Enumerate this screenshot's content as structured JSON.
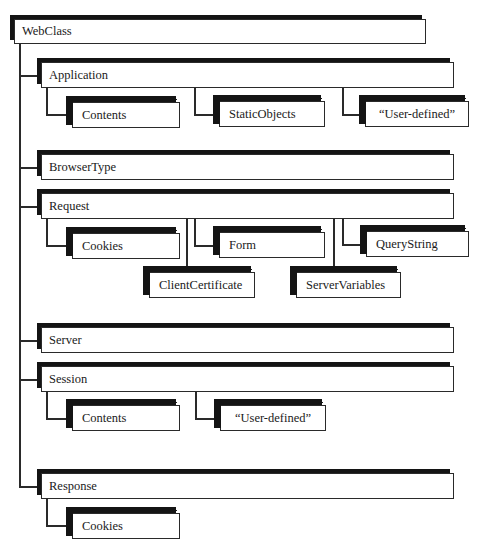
{
  "diagram": {
    "root": {
      "label": "WebClass"
    },
    "objects": {
      "application": {
        "label": "Application"
      },
      "browser_type": {
        "label": "BrowserType"
      },
      "request": {
        "label": "Request"
      },
      "server": {
        "label": "Server"
      },
      "session": {
        "label": "Session"
      },
      "response": {
        "label": "Response"
      }
    },
    "collections": {
      "application_contents": {
        "label": "Contents"
      },
      "application_static_objects": {
        "label": "StaticObjects"
      },
      "application_user_defined": {
        "label": "“User-defined”"
      },
      "request_cookies": {
        "label": "Cookies"
      },
      "request_form": {
        "label": "Form"
      },
      "request_query_string": {
        "label": "QueryString"
      },
      "request_client_certificate": {
        "label": "ClientCertificate"
      },
      "request_server_variables": {
        "label": "ServerVariables"
      },
      "session_contents": {
        "label": "Contents"
      },
      "session_user_defined": {
        "label": "“User-defined”"
      },
      "response_cookies": {
        "label": "Cookies"
      }
    },
    "hierarchy": [
      {
        "parent": "WebClass",
        "children": [
          "Application",
          "BrowserType",
          "Request",
          "Server",
          "Session",
          "Response"
        ]
      },
      {
        "parent": "Application",
        "children": [
          "Contents",
          "StaticObjects",
          "“User-defined”"
        ]
      },
      {
        "parent": "Request",
        "children": [
          "Cookies",
          "Form",
          "QueryString",
          "ClientCertificate",
          "ServerVariables"
        ]
      },
      {
        "parent": "Session",
        "children": [
          "Contents",
          "“User-defined”"
        ]
      },
      {
        "parent": "Response",
        "children": [
          "Cookies"
        ]
      }
    ]
  }
}
